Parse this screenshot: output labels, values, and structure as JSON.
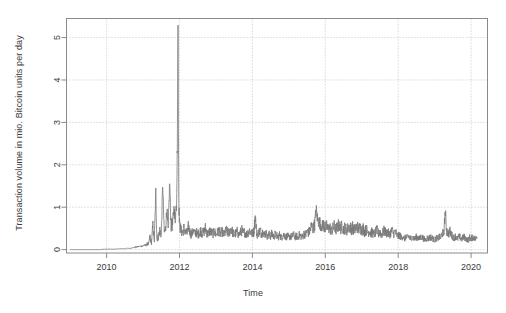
{
  "chart_data": {
    "type": "line",
    "title": "",
    "xlabel": "Time",
    "ylabel": "Transaction volume in mio. Bitcoin units per day",
    "xlim": [
      2008.9,
      2020.45
    ],
    "ylim": [
      -0.08,
      5.45
    ],
    "xticks": [
      2010,
      2012,
      2014,
      2016,
      2018,
      2020
    ],
    "xtick_labels": [
      "2010",
      "2012",
      "2014",
      "2016",
      "2018",
      "2020"
    ],
    "yticks": [
      0,
      1,
      2,
      3,
      4,
      5
    ],
    "ytick_labels": [
      "0",
      "1",
      "2",
      "3",
      "4",
      "5"
    ],
    "grid": "dotted-both-axes",
    "grid_color": "#b8b8b8",
    "line_color": "#787878",
    "legend": "none",
    "series": [
      {
        "name": "Bitcoin daily transaction volume",
        "x": [
          2009.0,
          2009.08,
          2009.17,
          2009.25,
          2009.33,
          2009.42,
          2009.5,
          2009.58,
          2009.67,
          2009.75,
          2009.83,
          2009.92,
          2010.0,
          2010.06,
          2010.12,
          2010.18,
          2010.25,
          2010.31,
          2010.37,
          2010.43,
          2010.5,
          2010.56,
          2010.62,
          2010.68,
          2010.75,
          2010.81,
          2010.87,
          2010.93,
          2011.0,
          2011.04,
          2011.08,
          2011.12,
          2011.15,
          2011.19,
          2011.23,
          2011.27,
          2011.31,
          2011.35,
          2011.38,
          2011.42,
          2011.46,
          2011.5,
          2011.54,
          2011.58,
          2011.62,
          2011.65,
          2011.69,
          2011.73,
          2011.77,
          2011.81,
          2011.85,
          2011.88,
          2011.92,
          2011.94,
          2011.96,
          2011.97,
          2011.98,
          2012.0,
          2012.04,
          2012.08,
          2012.12,
          2012.17,
          2012.21,
          2012.25,
          2012.29,
          2012.33,
          2012.37,
          2012.42,
          2012.46,
          2012.5,
          2012.54,
          2012.58,
          2012.62,
          2012.67,
          2012.71,
          2012.75,
          2012.79,
          2012.83,
          2012.87,
          2012.92,
          2012.96,
          2013.0,
          2013.04,
          2013.08,
          2013.12,
          2013.17,
          2013.21,
          2013.25,
          2013.29,
          2013.33,
          2013.37,
          2013.42,
          2013.46,
          2013.5,
          2013.54,
          2013.58,
          2013.62,
          2013.67,
          2013.71,
          2013.75,
          2013.79,
          2013.83,
          2013.87,
          2013.92,
          2013.96,
          2014.0,
          2014.04,
          2014.08,
          2014.12,
          2014.17,
          2014.21,
          2014.25,
          2014.29,
          2014.33,
          2014.37,
          2014.42,
          2014.46,
          2014.5,
          2014.54,
          2014.58,
          2014.62,
          2014.67,
          2014.71,
          2014.75,
          2014.79,
          2014.83,
          2014.87,
          2014.92,
          2014.96,
          2015.0,
          2015.04,
          2015.08,
          2015.12,
          2015.17,
          2015.21,
          2015.25,
          2015.29,
          2015.33,
          2015.37,
          2015.42,
          2015.46,
          2015.5,
          2015.54,
          2015.58,
          2015.62,
          2015.67,
          2015.71,
          2015.75,
          2015.79,
          2015.83,
          2015.87,
          2015.92,
          2015.96,
          2016.0,
          2016.04,
          2016.08,
          2016.12,
          2016.17,
          2016.21,
          2016.25,
          2016.29,
          2016.33,
          2016.37,
          2016.42,
          2016.46,
          2016.5,
          2016.54,
          2016.58,
          2016.62,
          2016.67,
          2016.71,
          2016.75,
          2016.79,
          2016.83,
          2016.87,
          2016.92,
          2016.96,
          2017.0,
          2017.04,
          2017.08,
          2017.12,
          2017.17,
          2017.21,
          2017.25,
          2017.29,
          2017.33,
          2017.37,
          2017.42,
          2017.46,
          2017.5,
          2017.54,
          2017.58,
          2017.62,
          2017.67,
          2017.71,
          2017.75,
          2017.79,
          2017.83,
          2017.87,
          2017.92,
          2017.96,
          2018.0,
          2018.04,
          2018.08,
          2018.12,
          2018.17,
          2018.21,
          2018.25,
          2018.29,
          2018.33,
          2018.37,
          2018.42,
          2018.46,
          2018.5,
          2018.54,
          2018.58,
          2018.62,
          2018.67,
          2018.71,
          2018.75,
          2018.79,
          2018.83,
          2018.87,
          2018.92,
          2018.96,
          2019.0,
          2019.04,
          2019.08,
          2019.12,
          2019.17,
          2019.21,
          2019.25,
          2019.29,
          2019.33,
          2019.37,
          2019.42,
          2019.46,
          2019.5,
          2019.54,
          2019.58,
          2019.62,
          2019.67,
          2019.71,
          2019.75,
          2019.79,
          2019.83,
          2019.87,
          2019.92,
          2019.96,
          2020.0,
          2020.04,
          2020.08,
          2020.12,
          2020.16
        ],
        "y": [
          0.0,
          0.0,
          0.0,
          0.0,
          0.0,
          0.0,
          0.0,
          0.0,
          0.0,
          0.0,
          0.0,
          0.01,
          0.01,
          0.01,
          0.01,
          0.01,
          0.01,
          0.02,
          0.02,
          0.02,
          0.02,
          0.03,
          0.03,
          0.04,
          0.05,
          0.06,
          0.07,
          0.08,
          0.09,
          0.11,
          0.1,
          0.14,
          0.12,
          0.3,
          0.16,
          0.55,
          0.2,
          1.35,
          0.25,
          0.3,
          0.45,
          0.35,
          1.55,
          0.4,
          0.5,
          0.95,
          0.45,
          1.6,
          0.55,
          0.6,
          0.95,
          0.7,
          1.1,
          2.4,
          5.45,
          3.1,
          1.2,
          0.6,
          0.45,
          0.4,
          0.5,
          0.42,
          0.38,
          0.55,
          0.4,
          0.35,
          0.45,
          0.38,
          0.42,
          0.35,
          0.4,
          0.45,
          0.38,
          0.42,
          0.5,
          0.4,
          0.35,
          0.45,
          0.4,
          0.38,
          0.42,
          0.35,
          0.4,
          0.45,
          0.38,
          0.42,
          0.35,
          0.4,
          0.45,
          0.38,
          0.42,
          0.5,
          0.4,
          0.35,
          0.38,
          0.42,
          0.35,
          0.4,
          0.45,
          0.38,
          0.42,
          0.35,
          0.4,
          0.45,
          0.4,
          0.38,
          0.42,
          0.8,
          0.35,
          0.4,
          0.45,
          0.38,
          0.42,
          0.35,
          0.4,
          0.3,
          0.35,
          0.32,
          0.38,
          0.3,
          0.35,
          0.32,
          0.3,
          0.35,
          0.28,
          0.32,
          0.35,
          0.3,
          0.32,
          0.28,
          0.32,
          0.3,
          0.35,
          0.3,
          0.32,
          0.28,
          0.35,
          0.32,
          0.3,
          0.38,
          0.35,
          0.42,
          0.4,
          0.45,
          0.55,
          0.5,
          0.6,
          0.95,
          0.7,
          0.65,
          0.6,
          0.55,
          0.58,
          0.5,
          0.55,
          0.48,
          0.52,
          0.45,
          0.5,
          0.55,
          0.48,
          0.52,
          0.58,
          0.5,
          0.55,
          0.48,
          0.52,
          0.45,
          0.5,
          0.55,
          0.48,
          0.52,
          0.45,
          0.5,
          0.55,
          0.48,
          0.52,
          0.45,
          0.5,
          0.42,
          0.48,
          0.4,
          0.45,
          0.38,
          0.42,
          0.35,
          0.4,
          0.45,
          0.38,
          0.42,
          0.35,
          0.4,
          0.45,
          0.38,
          0.42,
          0.35,
          0.4,
          0.45,
          0.38,
          0.42,
          0.35,
          0.3,
          0.35,
          0.28,
          0.32,
          0.25,
          0.3,
          0.28,
          0.32,
          0.25,
          0.3,
          0.28,
          0.25,
          0.3,
          0.28,
          0.25,
          0.3,
          0.28,
          0.25,
          0.22,
          0.28,
          0.25,
          0.3,
          0.28,
          0.25,
          0.22,
          0.28,
          0.25,
          0.3,
          0.28,
          0.4,
          0.35,
          0.9,
          0.45,
          0.38,
          0.42,
          0.35,
          0.3,
          0.28,
          0.32,
          0.25,
          0.3,
          0.28,
          0.25,
          0.3,
          0.28,
          0.25,
          0.22,
          0.28,
          0.25,
          0.3,
          0.28,
          0.25,
          0.3
        ]
      }
    ]
  }
}
